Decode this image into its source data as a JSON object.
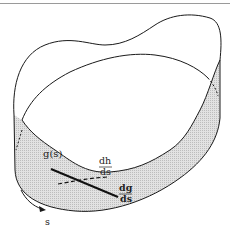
{
  "figure": {
    "labels": {
      "curve": "g(s)",
      "dh_num": "dh",
      "dh_den": "ds",
      "dg_num": "dg",
      "dg_den": "ds",
      "param": "s"
    },
    "colors": {
      "stroke": "#1a1a1a",
      "shade": "#d8d8d8",
      "rule": "#9a9a9a"
    }
  }
}
